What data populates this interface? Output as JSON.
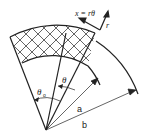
{
  "labels": {
    "coord_x": "x = rθ",
    "coord_r": "r",
    "theta": "θ",
    "theta0": "θ",
    "theta0_sub": "o",
    "radius_a": "a",
    "radius_b": "b"
  },
  "colors": {
    "stroke": "#222222",
    "background": "#ffffff"
  }
}
